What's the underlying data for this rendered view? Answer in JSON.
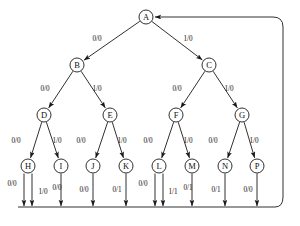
{
  "diagram": {
    "type": "state-transition-tree",
    "title": "",
    "node_radius": 7,
    "colors": {
      "stroke": "#1a1a1a",
      "node_fill": "#ffffff",
      "background": "#ffffff"
    },
    "nodes": [
      {
        "id": "A",
        "label": "A",
        "x": 146,
        "y": 17
      },
      {
        "id": "B",
        "label": "B",
        "x": 77,
        "y": 65
      },
      {
        "id": "C",
        "label": "C",
        "x": 209,
        "y": 65
      },
      {
        "id": "D",
        "label": "D",
        "x": 44,
        "y": 115
      },
      {
        "id": "E",
        "label": "E",
        "x": 110,
        "y": 115
      },
      {
        "id": "F",
        "label": "F",
        "x": 176,
        "y": 115
      },
      {
        "id": "G",
        "label": "G",
        "x": 242,
        "y": 115
      },
      {
        "id": "H",
        "label": "H",
        "x": 28,
        "y": 166
      },
      {
        "id": "I",
        "label": "I",
        "x": 61,
        "y": 166
      },
      {
        "id": "J",
        "label": "J",
        "x": 93,
        "y": 166
      },
      {
        "id": "K",
        "label": "K",
        "x": 126,
        "y": 166
      },
      {
        "id": "L",
        "label": "L",
        "x": 159,
        "y": 166
      },
      {
        "id": "M",
        "label": "M",
        "x": 192,
        "y": 166
      },
      {
        "id": "N",
        "label": "N",
        "x": 225,
        "y": 166
      },
      {
        "id": "P",
        "label": "P",
        "x": 257,
        "y": 166
      }
    ],
    "edges": [
      {
        "from": "A",
        "to": "B",
        "label": "0/0",
        "label_x": 97,
        "label_y": 39
      },
      {
        "from": "A",
        "to": "C",
        "label": "1/0",
        "label_x": 188,
        "label_y": 39
      },
      {
        "from": "B",
        "to": "D",
        "label": "0/0",
        "label_x": 45,
        "label_y": 89
      },
      {
        "from": "B",
        "to": "E",
        "label": "1/0",
        "label_x": 97,
        "label_y": 89
      },
      {
        "from": "C",
        "to": "F",
        "label": "0/0",
        "label_x": 177,
        "label_y": 89
      },
      {
        "from": "C",
        "to": "G",
        "label": "1/0",
        "label_x": 229,
        "label_y": 89
      },
      {
        "from": "D",
        "to": "H",
        "label": "0/0",
        "label_x": 16,
        "label_y": 141
      },
      {
        "from": "D",
        "to": "I",
        "label": "1/0",
        "label_x": 57,
        "label_y": 141
      },
      {
        "from": "E",
        "to": "J",
        "label": "0/0",
        "label_x": 81,
        "label_y": 141
      },
      {
        "from": "E",
        "to": "K",
        "label": "1/0",
        "label_x": 122,
        "label_y": 141
      },
      {
        "from": "F",
        "to": "L",
        "label": "0/0",
        "label_x": 148,
        "label_y": 141
      },
      {
        "from": "F",
        "to": "M",
        "label": "1/0",
        "label_x": 188,
        "label_y": 141
      },
      {
        "from": "G",
        "to": "N",
        "label": "0/0",
        "label_x": 213,
        "label_y": 141
      },
      {
        "from": "G",
        "to": "P",
        "label": "1/0",
        "label_x": 254,
        "label_y": 141
      }
    ],
    "terminal_edges": [
      {
        "from": "H",
        "label": "0/0",
        "x": 24,
        "label_x": 12,
        "label_y": 184
      },
      {
        "from": "H",
        "label": "1/0",
        "x": 32,
        "label_x": 43,
        "label_y": 192
      },
      {
        "from": "I",
        "label": "0/0",
        "x": 61,
        "label_x": 57,
        "label_y": 188
      },
      {
        "from": "J",
        "label": "0/0",
        "x": 93,
        "label_x": 84,
        "label_y": 190
      },
      {
        "from": "K",
        "label": "0/1",
        "x": 126,
        "label_x": 117,
        "label_y": 190
      },
      {
        "from": "L",
        "label": "0/0",
        "x": 155,
        "label_x": 143,
        "label_y": 184
      },
      {
        "from": "L",
        "label": "1/1",
        "x": 163,
        "label_x": 173,
        "label_y": 192
      },
      {
        "from": "M",
        "label": "0/1",
        "x": 192,
        "label_x": 188,
        "label_y": 188
      },
      {
        "from": "N",
        "label": "0/1",
        "x": 225,
        "label_x": 216,
        "label_y": 190
      },
      {
        "from": "P",
        "label": "0/0",
        "x": 257,
        "label_x": 248,
        "label_y": 190
      }
    ],
    "bus": {
      "y": 207,
      "x_start": 18,
      "x_end": 275
    },
    "feedback": {
      "description": "return path from output bus back to node A",
      "y_top": 17,
      "x_right": 283,
      "arrow_target_x": 156
    }
  }
}
